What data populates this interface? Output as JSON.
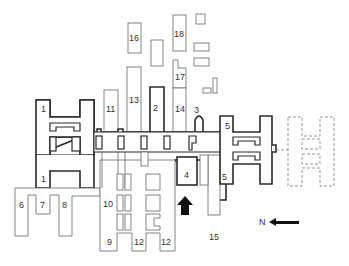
{
  "diagram": {
    "type": "floor-plan",
    "labels": {
      "b1a": "1",
      "b1b": "1",
      "b2": "2",
      "b3": "3",
      "b4": "4",
      "b5a": "5",
      "b5b": "5",
      "b6": "6",
      "b7": "7",
      "b8": "8",
      "b9": "9",
      "b10": "10",
      "b11": "11",
      "b12a": "12",
      "b12b": "12",
      "b13": "13",
      "b14": "14",
      "b15": "15",
      "b16": "16",
      "b17": "17",
      "b18": "18"
    },
    "compass": {
      "label": "N",
      "direction": "left"
    },
    "entrance_arrow": "up",
    "colors": {
      "line": "#2a2a2a",
      "thin_line": "#666666",
      "dashed": "#888888",
      "background": "#ffffff"
    }
  }
}
